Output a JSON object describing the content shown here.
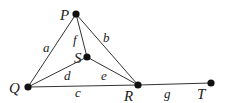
{
  "graph": {
    "vertices": [
      {
        "id": "P",
        "label": "P",
        "x": 76,
        "y": 14,
        "lx": 60,
        "ly": 20
      },
      {
        "id": "S",
        "label": "S",
        "x": 87,
        "y": 57,
        "lx": 74,
        "ly": 63
      },
      {
        "id": "Q",
        "label": "Q",
        "x": 28,
        "y": 87,
        "lx": 9,
        "ly": 93
      },
      {
        "id": "R",
        "label": "R",
        "x": 138,
        "y": 85,
        "lx": 124,
        "ly": 101
      },
      {
        "id": "T",
        "label": "T",
        "x": 211,
        "y": 83,
        "lx": 197,
        "ly": 99
      }
    ],
    "edges": [
      {
        "label": "a",
        "from": "P",
        "to": "Q",
        "lx": 43,
        "ly": 52
      },
      {
        "label": "b",
        "from": "P",
        "to": "R",
        "lx": 103,
        "ly": 42
      },
      {
        "label": "f",
        "from": "P",
        "to": "S",
        "lx": 73,
        "ly": 44
      },
      {
        "label": "d",
        "from": "Q",
        "to": "S",
        "lx": 64,
        "ly": 80
      },
      {
        "label": "e",
        "from": "S",
        "to": "R",
        "lx": 101,
        "ly": 80
      },
      {
        "label": "c",
        "from": "Q",
        "to": "R",
        "lx": 75,
        "ly": 97
      },
      {
        "label": "g",
        "from": "R",
        "to": "T",
        "lx": 164,
        "ly": 98
      }
    ]
  }
}
